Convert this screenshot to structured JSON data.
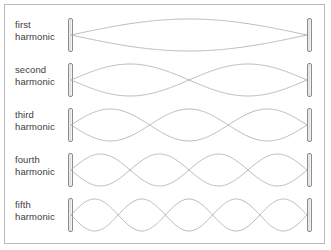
{
  "figure": {
    "background_color": "#ffffff",
    "border_color": "#b9b9b9",
    "wave_color": "#a8a8a8",
    "wall_color": "#8c8c8c",
    "label_color": "#3c3c3c"
  },
  "chart_data": {
    "type": "line",
    "xlabel": "",
    "ylabel": "",
    "grid": false,
    "legend_position": "left",
    "categories": [
      "first harmonic",
      "second harmonic",
      "third harmonic",
      "fourth harmonic",
      "fifth harmonic"
    ],
    "series": [
      {
        "name": "first harmonic",
        "harmonic_number": 1,
        "antinodes": 1,
        "interior_nodes": 0,
        "wavelengths_on_string": 0.5,
        "amplitude": 1.0
      },
      {
        "name": "second harmonic",
        "harmonic_number": 2,
        "antinodes": 2,
        "interior_nodes": 1,
        "wavelengths_on_string": 1.0,
        "amplitude": 1.0
      },
      {
        "name": "third harmonic",
        "harmonic_number": 3,
        "antinodes": 3,
        "interior_nodes": 2,
        "wavelengths_on_string": 1.5,
        "amplitude": 1.0
      },
      {
        "name": "fourth harmonic",
        "harmonic_number": 4,
        "antinodes": 4,
        "interior_nodes": 3,
        "wavelengths_on_string": 2.0,
        "amplitude": 1.0
      },
      {
        "name": "fifth harmonic",
        "harmonic_number": 5,
        "antinodes": 5,
        "interior_nodes": 4,
        "wavelengths_on_string": 2.5,
        "amplitude": 1.0
      }
    ]
  },
  "rows": [
    {
      "label": "first\nharmonic",
      "label_line_1": "first",
      "label_line_2": "harmonic",
      "harmonic_number": 1,
      "top": 7,
      "wall_top": 13,
      "wall_height": 34,
      "amplitude": 16
    },
    {
      "label": "second\nharmonic",
      "label_line_1": "second",
      "label_line_2": "harmonic",
      "harmonic_number": 2,
      "top": 52,
      "wall_top": 58,
      "wall_height": 34,
      "amplitude": 16
    },
    {
      "label": "third\nharmonic",
      "label_line_1": "third",
      "label_line_2": "harmonic",
      "harmonic_number": 3,
      "top": 97,
      "wall_top": 103,
      "wall_height": 34,
      "amplitude": 16
    },
    {
      "label": "fourth\nharmonic",
      "label_line_1": "fourth",
      "label_line_2": "harmonic",
      "harmonic_number": 4,
      "top": 142,
      "wall_top": 148,
      "wall_height": 34,
      "amplitude": 16
    },
    {
      "label": "fifth\nharmonic",
      "label_line_1": "fifth",
      "label_line_2": "harmonic",
      "harmonic_number": 5,
      "top": 187,
      "wall_top": 193,
      "wall_height": 34,
      "amplitude": 16
    }
  ]
}
